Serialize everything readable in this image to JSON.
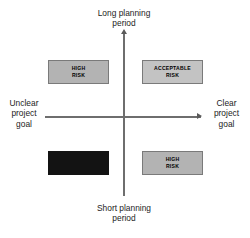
{
  "diagram": {
    "type": "risk-matrix",
    "axes": {
      "vertical": {
        "top_label": "Long planning\nperiod",
        "bottom_label": "Short planning\nperiod"
      },
      "horizontal": {
        "left_label": "Unclear\nproject\ngoal",
        "right_label": "Clear\nproject\ngoal"
      }
    },
    "quadrants": [
      {
        "position": "top-left",
        "line1": "HIGH",
        "line2": "RISK",
        "fill": "#b3b3b3"
      },
      {
        "position": "top-right",
        "line1": "ACCEPTABLE",
        "line2": "RISK",
        "fill": "#c3c3c3"
      },
      {
        "position": "bottom-left",
        "line1": "",
        "line2": "",
        "fill": "#131313"
      },
      {
        "position": "bottom-right",
        "line1": "HIGH",
        "line2": "RISK",
        "fill": "#b3b3b3"
      }
    ]
  }
}
